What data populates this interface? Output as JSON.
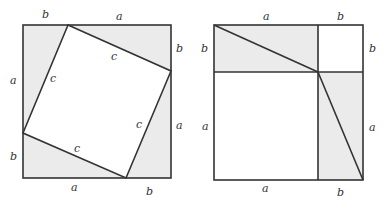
{
  "colors": {
    "shade": "#ebebeb",
    "line": "#333333",
    "background": "#ffffff"
  },
  "left_figure": {
    "description": "Square of side a+b containing a tilted inner square of side c and four right triangles",
    "labels": {
      "top_b": "b",
      "top_a": "a",
      "right_b": "b",
      "right_a": "a",
      "bottom_a": "a",
      "bottom_b": "b",
      "left_a": "a",
      "left_b": "b",
      "c_left": "c",
      "c_top": "c",
      "c_right": "c",
      "c_bottom": "c"
    }
  },
  "right_figure": {
    "description": "Square of side a+b divided into a^2 square, b^2 square and two a×b rectangles split by diagonals",
    "labels": {
      "top_a": "a",
      "top_b": "b",
      "left_b": "b",
      "right_b": "b",
      "left_a": "a",
      "right_a": "a",
      "bottom_a": "a",
      "bottom_b": "b"
    }
  }
}
